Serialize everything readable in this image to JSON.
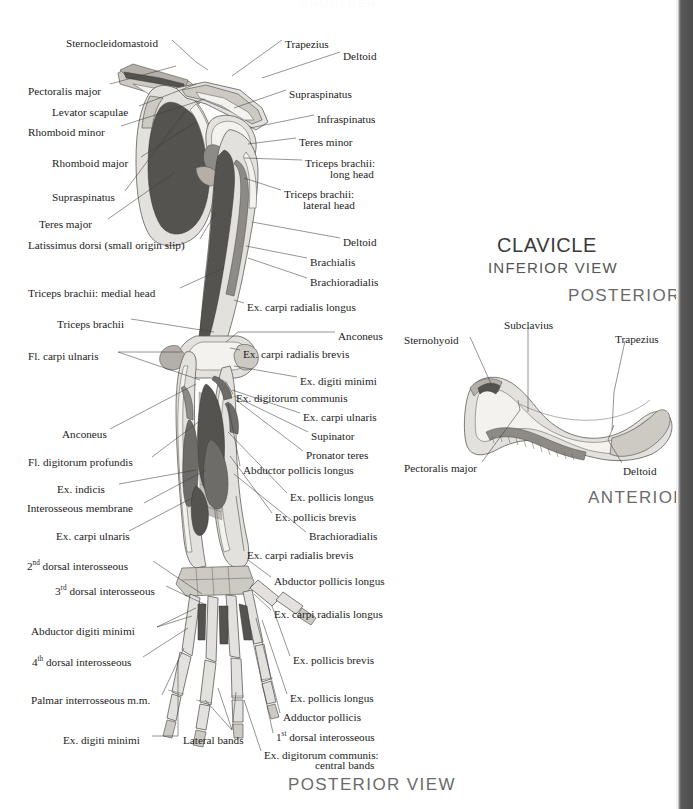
{
  "page": {
    "running_header": "SHOULDER",
    "background_color": "#ffffff",
    "gutter_color": "#4f4f4f"
  },
  "main_figure": {
    "caption": "POSTERIOR VIEW",
    "subject": "scapula-humerus-radius-ulna-hand-posterior",
    "labels_left": [
      {
        "text": "Sternocleidomastoid",
        "x": 66,
        "y": 37
      },
      {
        "text": "Pectoralis major",
        "x": 28,
        "y": 85
      },
      {
        "text": "Levator scapulae",
        "x": 52,
        "y": 106
      },
      {
        "text": "Rhomboid minor",
        "x": 28,
        "y": 126
      },
      {
        "text": "Rhomboid major",
        "x": 52,
        "y": 157
      },
      {
        "text": "Supraspinatus",
        "x": 52,
        "y": 191
      },
      {
        "text": "Teres major",
        "x": 39,
        "y": 218
      },
      {
        "text": "Latissimus dorsi (small origin slip)",
        "x": 28,
        "y": 239
      },
      {
        "text": "Triceps brachii: medial head",
        "x": 28,
        "y": 287
      },
      {
        "text": "Triceps brachii",
        "x": 57,
        "y": 318
      },
      {
        "text": "Fl. carpi ulnaris",
        "x": 28,
        "y": 350
      },
      {
        "text": "Anconeus",
        "x": 62,
        "y": 428
      },
      {
        "text": "Fl. digitorum profundis",
        "x": 28,
        "y": 456
      },
      {
        "text": "Ex. indicis",
        "x": 57,
        "y": 483
      },
      {
        "text": "Interosseous membrane",
        "x": 27,
        "y": 502
      },
      {
        "text": "Ex. carpi ulnaris",
        "x": 56,
        "y": 530
      },
      {
        "text": "2<sup>nd</sup> dorsal interosseous",
        "x": 27,
        "y": 560
      },
      {
        "text": "3<sup>rd</sup> dorsal interosseous",
        "x": 55,
        "y": 585
      },
      {
        "text": "Abductor digiti minimi",
        "x": 31,
        "y": 625
      },
      {
        "text": "4<sup>th</sup> dorsal interosseous",
        "x": 32,
        "y": 656
      },
      {
        "text": "Palmar interrosseous m.m.",
        "x": 31,
        "y": 694
      },
      {
        "text": "Ex. digiti minimi",
        "x": 63,
        "y": 734
      }
    ],
    "labels_bottom_center": [
      {
        "text": "Lateral bands",
        "x": 183,
        "y": 734
      }
    ],
    "labels_right": [
      {
        "text": "Trapezius",
        "x": 285,
        "y": 38
      },
      {
        "text": "Deltoid",
        "x": 343,
        "y": 50
      },
      {
        "text": "Supraspinatus",
        "x": 289,
        "y": 88
      },
      {
        "text": "Infraspinatus",
        "x": 317,
        "y": 113
      },
      {
        "text": "Teres minor",
        "x": 299,
        "y": 136
      },
      {
        "text": "Triceps brachii:",
        "x": 305,
        "y": 157
      },
      {
        "text": "long head",
        "x": 330,
        "y": 168
      },
      {
        "text": "Triceps brachii:",
        "x": 284,
        "y": 188
      },
      {
        "text": "lateral head",
        "x": 303,
        "y": 199
      },
      {
        "text": "Deltoid",
        "x": 343,
        "y": 236
      },
      {
        "text": "Brachialis",
        "x": 310,
        "y": 256
      },
      {
        "text": "Brachioradialis",
        "x": 310,
        "y": 276
      },
      {
        "text": "Ex. carpi radialis longus",
        "x": 247,
        "y": 301
      },
      {
        "text": "Anconeus",
        "x": 338,
        "y": 330
      },
      {
        "text": "Ex. carpi radialis brevis",
        "x": 243,
        "y": 348
      },
      {
        "text": "Ex. digiti minimi",
        "x": 300,
        "y": 375
      },
      {
        "text": "Ex. digitorum communis",
        "x": 236,
        "y": 392
      },
      {
        "text": "Ex. carpi ulnaris",
        "x": 303,
        "y": 411
      },
      {
        "text": "Supinator",
        "x": 311,
        "y": 430
      },
      {
        "text": "Pronator teres",
        "x": 306,
        "y": 449
      },
      {
        "text": "Abductor pollicis longus",
        "x": 243,
        "y": 464
      },
      {
        "text": "Ex. pollicis longus",
        "x": 290,
        "y": 491
      },
      {
        "text": "Ex. pollicis brevis",
        "x": 275,
        "y": 511
      },
      {
        "text": "Brachioradialis",
        "x": 309,
        "y": 530
      },
      {
        "text": "Ex. carpi radialis brevis",
        "x": 247,
        "y": 549
      },
      {
        "text": "Abductor pollicis longus",
        "x": 274,
        "y": 575
      },
      {
        "text": "Ex. carpi radialis longus",
        "x": 274,
        "y": 608
      },
      {
        "text": "Ex. pollicis brevis",
        "x": 293,
        "y": 654
      },
      {
        "text": "Ex. pollicis longus",
        "x": 290,
        "y": 692
      },
      {
        "text": "Adductor pollicis",
        "x": 283,
        "y": 711
      },
      {
        "text": "1<sup>st</sup> dorsal interosseous",
        "x": 276,
        "y": 731
      },
      {
        "text": "Ex. digitorum communis:",
        "x": 264,
        "y": 749
      },
      {
        "text": "central bands",
        "x": 315,
        "y": 759
      }
    ]
  },
  "clavicle_figure": {
    "title": "CLAVICLE",
    "subtitle": "INFERIOR VIEW",
    "orientation_top": "POSTERIOR",
    "orientation_bottom": "ANTERIOR",
    "labels": [
      {
        "text": "Subclavius",
        "x": 504,
        "y": 319
      },
      {
        "text": "Trapezius",
        "x": 615,
        "y": 333
      },
      {
        "text": "Sternohyoid",
        "x": 404,
        "y": 334
      },
      {
        "text": "Pectoralis major",
        "x": 404,
        "y": 462
      },
      {
        "text": "Deltoid",
        "x": 623,
        "y": 465
      }
    ]
  }
}
